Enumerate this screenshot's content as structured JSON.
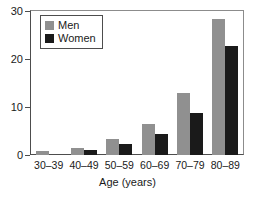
{
  "chart_data": {
    "type": "bar",
    "title": "",
    "subtitle": "",
    "xlabel": "Age (years)",
    "ylabel": "",
    "categories": [
      "30–39",
      "40–49",
      "50–59",
      "60–69",
      "70–79",
      "80–89"
    ],
    "series": [
      {
        "name": "Men",
        "color": "#909090",
        "values": [
          0.8,
          1.5,
          3.3,
          6.5,
          13.0,
          28.3
        ]
      },
      {
        "name": "Women",
        "color": "#1a1a1a",
        "values": [
          0,
          1.1,
          2.2,
          4.4,
          8.7,
          22.8
        ]
      }
    ],
    "ylim": [
      0,
      30
    ],
    "yticks": [
      0,
      10,
      20,
      30
    ],
    "ytick_labels": [
      "0",
      "10",
      "20",
      "30"
    ],
    "grid": false,
    "legend_position": "upper-left",
    "legend_entries": [
      "Men",
      "Women"
    ],
    "axis_frame": "box",
    "background_color": "#ffffff",
    "axis_color": "#4d4d4d"
  }
}
